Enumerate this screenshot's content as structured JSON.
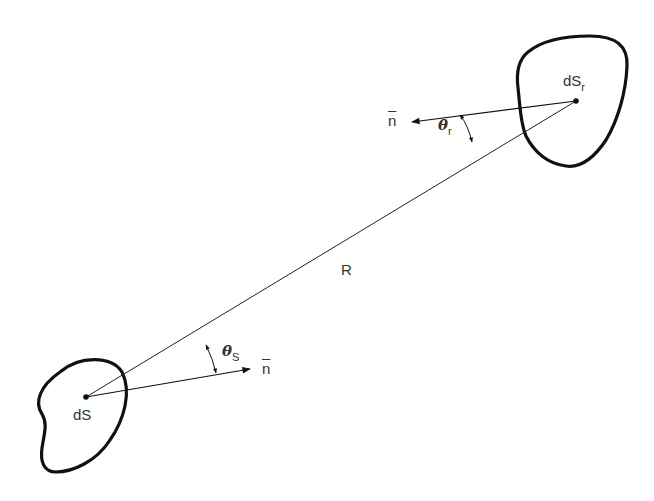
{
  "diagram": {
    "type": "radiation view-factor geometry",
    "surfaces": [
      {
        "id": "emitter",
        "label": "dS",
        "subscript": ""
      },
      {
        "id": "receiver",
        "label": "dS",
        "subscript": "r"
      }
    ],
    "distance_label": "R",
    "normals": [
      {
        "at": "emitter",
        "label": "n"
      },
      {
        "at": "receiver",
        "label": "n"
      }
    ],
    "angles": [
      {
        "at": "emitter",
        "symbol": "θ",
        "subscript": "S"
      },
      {
        "at": "receiver",
        "symbol": "θ",
        "subscript": "r"
      }
    ],
    "colors": {
      "stroke": "#111111",
      "text": "#333333",
      "background": "#ffffff"
    }
  }
}
